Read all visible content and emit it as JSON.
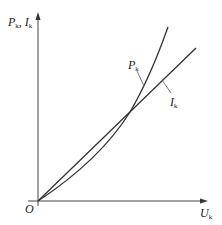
{
  "diagram": {
    "type": "characteristic-curves",
    "y_axis_label": {
      "main": "P",
      "sub": "k",
      "sep": ", ",
      "main2": "I",
      "sub2": "k"
    },
    "x_axis_label": {
      "main": "U",
      "sub": "k"
    },
    "origin_label": "O",
    "curves": [
      {
        "name": "P_k",
        "label_main": "P",
        "label_sub": "k",
        "shape": "convex (parabolic)"
      },
      {
        "name": "I_k",
        "label_main": "I",
        "label_sub": "k",
        "shape": "straight line through origin"
      }
    ],
    "colors": {
      "line": "#333333",
      "background": "#ffffff"
    }
  }
}
